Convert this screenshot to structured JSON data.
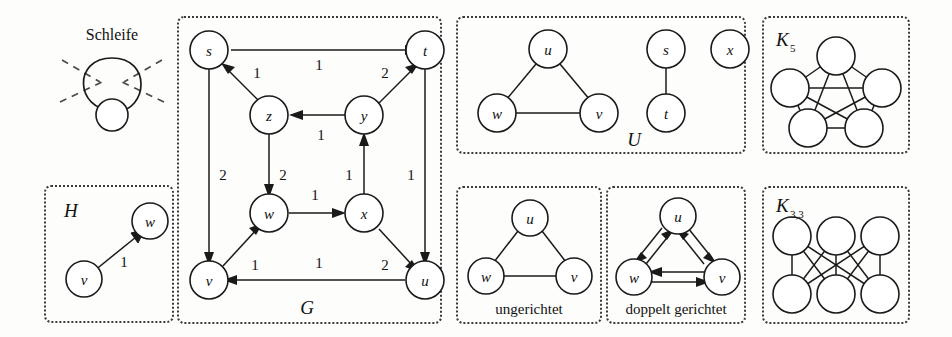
{
  "figure": {
    "title_visible": false,
    "panels": [
      {
        "id": "schleife",
        "label": "Schleife",
        "label_kind": "heading"
      },
      {
        "id": "h",
        "label": "H",
        "label_kind": "graph-name"
      },
      {
        "id": "g",
        "label": "G",
        "label_kind": "graph-name"
      },
      {
        "id": "u",
        "label": "U",
        "label_kind": "graph-name"
      },
      {
        "id": "ungerichtet",
        "label": "ungerichtet",
        "label_kind": "caption"
      },
      {
        "id": "doppelt",
        "label": "doppelt gerichtet",
        "label_kind": "caption"
      },
      {
        "id": "k5",
        "label": "K",
        "label_sub": "5",
        "label_kind": "graph-name"
      },
      {
        "id": "k33",
        "label": "K",
        "label_sub": "3,3",
        "label_kind": "graph-name"
      }
    ]
  },
  "schleife": {
    "heading": "Schleife",
    "node_count": 1,
    "self_loop": true,
    "dashed_rays": 4
  },
  "graph_h": {
    "name": "H",
    "directed": true,
    "nodes": [
      {
        "id": "v",
        "label": "v",
        "x": 40,
        "y": 92
      },
      {
        "id": "w",
        "label": "w",
        "x": 108,
        "y": 32
      }
    ],
    "edges": [
      {
        "from": "v",
        "to": "w",
        "weight": "1",
        "directed": true
      }
    ]
  },
  "graph_g": {
    "name": "G",
    "directed": true,
    "weighted": true,
    "nodes": [
      {
        "id": "s",
        "label": "s",
        "x": 34,
        "y": 35
      },
      {
        "id": "t",
        "label": "t",
        "x": 254,
        "y": 35
      },
      {
        "id": "z",
        "label": "z",
        "x": 94,
        "y": 100
      },
      {
        "id": "y",
        "label": "y",
        "x": 189,
        "y": 100
      },
      {
        "id": "w",
        "label": "w",
        "x": 94,
        "y": 198
      },
      {
        "id": "x",
        "label": "x",
        "x": 189,
        "y": 198
      },
      {
        "id": "v",
        "label": "v",
        "x": 34,
        "y": 265
      },
      {
        "id": "u",
        "label": "u",
        "x": 254,
        "y": 265
      }
    ],
    "edges": [
      {
        "from": "s",
        "to": "t",
        "weight": "1",
        "directed": true
      },
      {
        "from": "z",
        "to": "s",
        "weight": "1",
        "directed": true
      },
      {
        "from": "y",
        "to": "t",
        "weight": "2",
        "directed": true
      },
      {
        "from": "y",
        "to": "z",
        "weight": "1",
        "directed": true
      },
      {
        "from": "s",
        "to": "v",
        "weight": "2",
        "directed": true
      },
      {
        "from": "z",
        "to": "w",
        "weight": "2",
        "directed": true
      },
      {
        "from": "x",
        "to": "y",
        "weight": "1",
        "directed": true
      },
      {
        "from": "t",
        "to": "u",
        "weight": "1",
        "directed": true
      },
      {
        "from": "w",
        "to": "x",
        "weight": "1",
        "directed": true
      },
      {
        "from": "v",
        "to": "w",
        "weight": "1",
        "directed": true
      },
      {
        "from": "x",
        "to": "u",
        "weight": "2",
        "directed": true
      },
      {
        "from": "u",
        "to": "v",
        "weight": "1",
        "directed": true
      }
    ]
  },
  "graph_u": {
    "name": "U",
    "directed": false,
    "nodes": [
      {
        "id": "u",
        "label": "u",
        "x": 90,
        "y": 33
      },
      {
        "id": "w",
        "label": "w",
        "x": 40,
        "y": 98
      },
      {
        "id": "v",
        "label": "v",
        "x": 140,
        "y": 98
      },
      {
        "id": "s",
        "label": "s",
        "x": 212,
        "y": 33
      },
      {
        "id": "t",
        "label": "t",
        "x": 212,
        "y": 98
      },
      {
        "id": "x",
        "label": "x",
        "x": 277,
        "y": 33
      }
    ],
    "edges": [
      {
        "from": "u",
        "to": "w",
        "directed": false
      },
      {
        "from": "u",
        "to": "v",
        "directed": false
      },
      {
        "from": "w",
        "to": "v",
        "directed": false
      },
      {
        "from": "s",
        "to": "t",
        "directed": false
      }
    ]
  },
  "graph_ungerichtet": {
    "caption": "ungerichtet",
    "directed": false,
    "nodes": [
      {
        "id": "u",
        "label": "u",
        "x": 82,
        "y": 32
      },
      {
        "id": "w",
        "label": "w",
        "x": 32,
        "y": 97
      },
      {
        "id": "v",
        "label": "v",
        "x": 132,
        "y": 97
      }
    ],
    "edges": [
      {
        "from": "u",
        "to": "w",
        "directed": false
      },
      {
        "from": "u",
        "to": "v",
        "directed": false
      },
      {
        "from": "w",
        "to": "v",
        "directed": false
      }
    ]
  },
  "graph_doppelt": {
    "caption": "doppelt gerichtet",
    "directed": true,
    "bidirectional": true,
    "nodes": [
      {
        "id": "u",
        "label": "u",
        "x": 82,
        "y": 32
      },
      {
        "id": "w",
        "label": "w",
        "x": 32,
        "y": 97
      },
      {
        "id": "v",
        "label": "v",
        "x": 132,
        "y": 97
      }
    ],
    "edges": [
      {
        "from": "u",
        "to": "w",
        "directed": true,
        "paired": true
      },
      {
        "from": "w",
        "to": "u",
        "directed": true,
        "paired": true
      },
      {
        "from": "u",
        "to": "v",
        "directed": true,
        "paired": true
      },
      {
        "from": "v",
        "to": "u",
        "directed": true,
        "paired": true
      },
      {
        "from": "w",
        "to": "v",
        "directed": true,
        "paired": true
      },
      {
        "from": "v",
        "to": "w",
        "directed": true,
        "paired": true
      }
    ]
  },
  "graph_k5": {
    "name": "K",
    "subscript": "5",
    "directed": false,
    "node_count": 5,
    "edge_count": 10,
    "layout": "pentagon"
  },
  "graph_k33": {
    "name": "K",
    "subscript": "3,3",
    "directed": false,
    "node_count": 6,
    "edge_count": 9,
    "layout": "bipartite-3x3"
  },
  "colors": {
    "ink": "#1a1a1a",
    "paper": "#fdfdfc",
    "border": "#3a3a3a",
    "dash": "#4a4a4a"
  }
}
